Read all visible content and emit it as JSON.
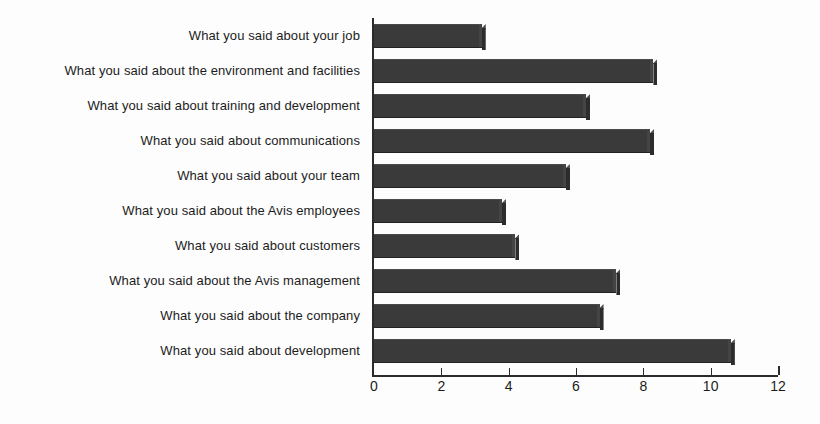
{
  "chart_data": {
    "type": "bar",
    "orientation": "horizontal",
    "title": "",
    "subtitle": "",
    "xlabel": "",
    "ylabel": "",
    "xlim": [
      0,
      12
    ],
    "xticks": [
      0,
      2,
      4,
      6,
      8,
      10,
      12
    ],
    "xtick_labels": [
      "0",
      "2",
      "4",
      "6",
      "8",
      "10",
      "12"
    ],
    "grid": false,
    "legend": false,
    "bar_color": "#3a3a3a",
    "axis_color": "#2b2b2b",
    "background_color": "#ffffff",
    "categories": [
      "What you said about your job",
      "What you said about the environment and facilities",
      "What you said about training and development",
      "What you said about communications",
      "What you said about your team",
      "What you said about the Avis employees",
      "What you said about customers",
      "What you said about the Avis management",
      "What you said about the company",
      "What you said about development"
    ],
    "values": [
      3.2,
      8.3,
      6.3,
      8.2,
      5.7,
      3.8,
      4.2,
      7.2,
      6.7,
      10.6
    ]
  }
}
